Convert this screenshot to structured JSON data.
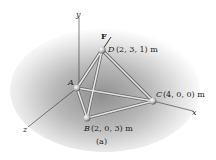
{
  "figure": {
    "caption": "(a)",
    "axes": {
      "x": "x",
      "y": "y",
      "z": "z"
    },
    "force": {
      "label": "F"
    },
    "points": {
      "A": {
        "name": "A",
        "coords": ""
      },
      "B": {
        "name": "B",
        "coords": "(2, 0, 3) m"
      },
      "C": {
        "name": "C",
        "coords": "(4, 0, 0) m"
      },
      "D": {
        "name": "D",
        "coords": "(2, 3, 1) m"
      }
    },
    "colors": {
      "shade": "#9a9a9a",
      "member": "#d8d8d8",
      "member_edge": "#6a6a6a",
      "axis": "#333333"
    }
  }
}
